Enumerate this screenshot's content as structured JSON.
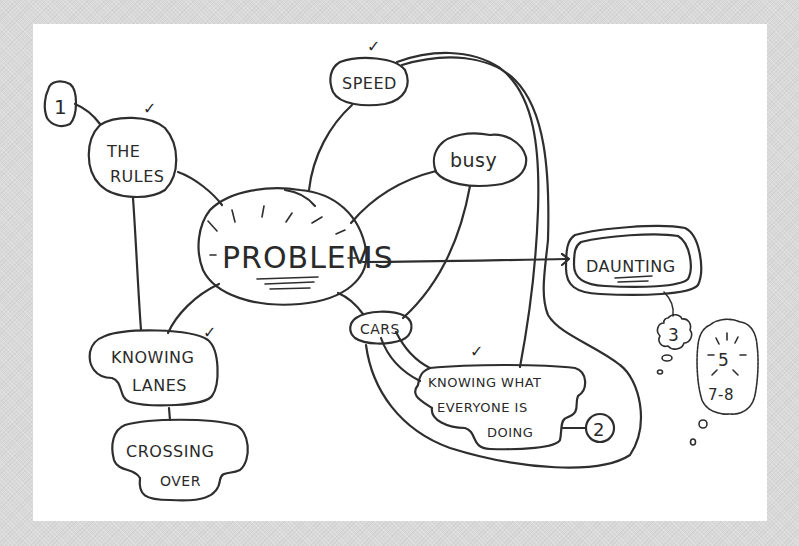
{
  "diagram": {
    "type": "mind-map",
    "style": "hand-drawn",
    "colors": {
      "ink": "#2e2e2e",
      "paper": "#ffffff",
      "frame": "#d9d9d9"
    },
    "central": {
      "label": "PROBLEMS"
    },
    "nodes": [
      {
        "id": "the-rules",
        "lines": [
          "THE",
          "RULES"
        ],
        "checked": true,
        "badge": "1"
      },
      {
        "id": "speed",
        "lines": [
          "SPEED"
        ],
        "checked": true
      },
      {
        "id": "busy",
        "lines": [
          "busy"
        ],
        "checked": false
      },
      {
        "id": "daunting",
        "lines": [
          "DAUNTING"
        ],
        "checked": false,
        "badges": [
          "3",
          "5",
          "7-8"
        ]
      },
      {
        "id": "cars",
        "lines": [
          "CARS"
        ],
        "checked": false
      },
      {
        "id": "knowing-what",
        "lines": [
          "KNOWING WHAT",
          "EVERYONE IS",
          "DOING"
        ],
        "checked": true,
        "badge": "2"
      },
      {
        "id": "knowing-lanes",
        "lines": [
          "KNOWING",
          "LANES"
        ],
        "checked": true
      },
      {
        "id": "crossing-over",
        "lines": [
          "CROSSING",
          "OVER"
        ],
        "checked": false
      }
    ],
    "badges": {
      "one": "1",
      "two": "2",
      "three": "3",
      "five": "5",
      "seven_eight": "7-8"
    },
    "checkmark": "✓"
  }
}
